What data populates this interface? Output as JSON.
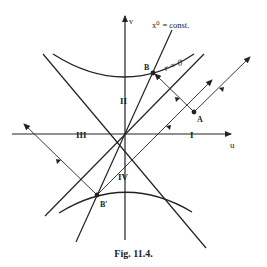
{
  "figure": {
    "caption": "Fig. 11.4.",
    "axes": {
      "horizontal": "u",
      "vertical": "v"
    },
    "regions": {
      "r1": "I",
      "r2": "II",
      "r3": "III",
      "r4": "IV"
    },
    "labels": {
      "x0_const": "x⁰ = const.",
      "r_zero": "r = 0",
      "point_B": "B",
      "point_A": "A",
      "point_Bprime": "B′"
    },
    "colors": {
      "ink": "#222222",
      "background": "#ffffff"
    }
  }
}
